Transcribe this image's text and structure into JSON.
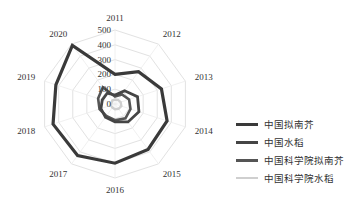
{
  "chart_data": {
    "type": "radar",
    "title": "",
    "categories": [
      "2011",
      "2012",
      "2013",
      "2014",
      "2015",
      "2016",
      "2017",
      "2018",
      "2019",
      "2020"
    ],
    "radial_ticks": [
      "0",
      "100",
      "200",
      "300",
      "400",
      "500"
    ],
    "rlim": [
      0,
      500
    ],
    "grid": true,
    "legend_position": "right",
    "series": [
      {
        "name": "中国拟南芥",
        "color": "#3a3a3a",
        "width": 3.2,
        "values": [
          200,
          270,
          330,
          370,
          380,
          400,
          430,
          440,
          420,
          490
        ]
      },
      {
        "name": "中国水稻",
        "color": "#454545",
        "width": 2.8,
        "values": [
          60,
          110,
          160,
          170,
          150,
          120,
          110,
          100,
          90,
          90
        ]
      },
      {
        "name": "中国科学院拟南芥",
        "color": "#555555",
        "width": 2.6,
        "values": [
          50,
          80,
          100,
          110,
          120,
          110,
          100,
          110,
          120,
          140
        ]
      },
      {
        "name": "中国科学院水稻",
        "color": "#cfcfcf",
        "width": 2.4,
        "values": [
          30,
          35,
          40,
          45,
          40,
          35,
          30,
          30,
          25,
          30
        ]
      }
    ]
  }
}
